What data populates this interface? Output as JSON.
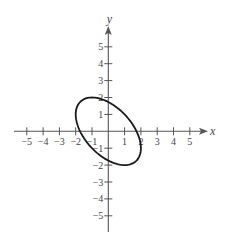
{
  "chart_data": {
    "type": "line",
    "title": "",
    "xlabel": "x",
    "ylabel": "y",
    "xlim": [
      -5,
      5
    ],
    "ylim": [
      -5,
      5
    ],
    "grid": false,
    "x_ticks": [
      -5,
      -4,
      -3,
      -2,
      -1,
      1,
      2,
      3,
      4,
      5
    ],
    "y_ticks": [
      5,
      4,
      3,
      2,
      1,
      -1,
      -2,
      -3,
      -4,
      -5
    ],
    "x_tick_labels": [
      "-5",
      "-4",
      "-3",
      "-2",
      "-1",
      "1",
      "2",
      "3",
      "4",
      "5"
    ],
    "y_tick_labels": [
      "5",
      "4",
      "3",
      "2",
      "1",
      "-1",
      "-2",
      "-3",
      "-4",
      "-5"
    ],
    "series": [
      {
        "name": "ellipse",
        "equation": "x^2 + xy + y^2 = 3",
        "curve": "closed",
        "key_points": [
          {
            "x": -1,
            "y": 2
          },
          {
            "x": 1,
            "y": -2
          },
          {
            "x": -2,
            "y": 1
          },
          {
            "x": 2,
            "y": -1
          },
          {
            "x": 1.732,
            "y": 0
          },
          {
            "x": -1.732,
            "y": 0
          },
          {
            "x": 0,
            "y": 1.732
          },
          {
            "x": 0,
            "y": -1.732
          }
        ]
      }
    ]
  },
  "colors": {
    "axis": "#555555",
    "curve": "#1a1a1a",
    "text": "#444444"
  }
}
